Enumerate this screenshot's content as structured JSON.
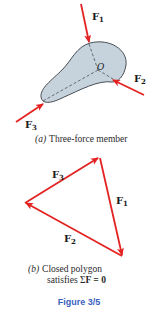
{
  "part_a": {
    "forces": [
      {
        "label": "F",
        "sub": "1"
      },
      {
        "label": "F",
        "sub": "2"
      },
      {
        "label": "F",
        "sub": "3"
      }
    ],
    "point_label": "O",
    "caption_prefix": "(a)",
    "caption": "Three-force member"
  },
  "part_b": {
    "forces": [
      {
        "label": "F",
        "sub": "1"
      },
      {
        "label": "F",
        "sub": "2"
      },
      {
        "label": "F",
        "sub": "3"
      }
    ],
    "caption_prefix": "(b)",
    "caption_line1": "Closed polygon",
    "caption_line2_pre": "satisfies Σ",
    "caption_line2_bold": "F = 0"
  },
  "figure_label": "Figure 3/5",
  "colors": {
    "force": "#e32322",
    "body_fill": "#c7d3dc",
    "body_stroke": "#4a4f55",
    "figure_label": "#3b5fbf"
  }
}
